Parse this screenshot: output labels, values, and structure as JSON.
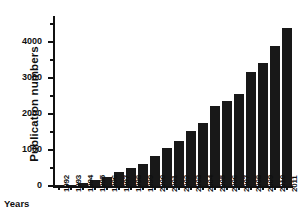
{
  "chart_data": {
    "type": "bar",
    "title": "",
    "subtitle": "",
    "xlabel": "Years",
    "ylabel": "Publication numbers",
    "categories": [
      "1992",
      "1993",
      "1994",
      "1995",
      "1996",
      "1997",
      "1998",
      "1999",
      "2000",
      "2001",
      "2002",
      "2003",
      "2004",
      "2005",
      "2006",
      "2007",
      "2008",
      "2009",
      "2010",
      "2011"
    ],
    "values": [
      10,
      40,
      70,
      160,
      240,
      400,
      510,
      610,
      820,
      1060,
      1240,
      1540,
      1750,
      2230,
      2370,
      2550,
      3160,
      3420,
      3890,
      4400
    ],
    "ylim": [
      0,
      4600
    ],
    "y_major_ticks": [
      0,
      1000,
      2000,
      3000,
      4000
    ],
    "y_tick_labels": [
      "0",
      "1000",
      "2000",
      "3000",
      "4000"
    ],
    "y_minor_ticks": [
      500,
      1500,
      2500,
      3500,
      4500
    ],
    "grid": false,
    "legend": null,
    "legend_position": "none",
    "bar_color": "#181818",
    "axis_color": "#111111",
    "background": "#ffffff"
  }
}
